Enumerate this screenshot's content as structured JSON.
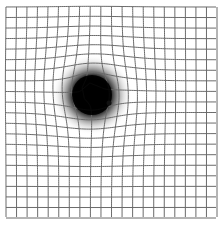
{
  "diagram": {
    "type": "amsler-grid",
    "grid": {
      "columns": 20,
      "rows": 20,
      "origin_x": 6,
      "origin_y": 7,
      "cell_size": 10.55,
      "line_color": "#6a6a6a"
    },
    "scotoma": {
      "center_x": 92,
      "center_y": 95,
      "core_radius": 20,
      "halo_radius": 40,
      "color": "#000000"
    },
    "small_dot": {
      "x": 109,
      "y": 103,
      "radius": 2.5,
      "color": "#111111"
    },
    "distortion": {
      "center_x": 92,
      "center_y": 92,
      "strength": 14,
      "falloff": 38
    }
  }
}
